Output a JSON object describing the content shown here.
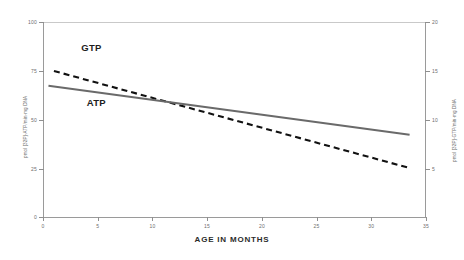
{
  "chart_data": {
    "type": "line",
    "title": "",
    "xlabel": "AGE IN MONTHS",
    "ylabel_left": "pmol [32P]-ATP/min·mg DNA",
    "ylabel_right": "pmol [32P]-GTP/min·mg DNA",
    "xlim": [
      0,
      35
    ],
    "ylim_left": [
      0,
      100
    ],
    "ylim_right": [
      0,
      20
    ],
    "xticks": [
      "0",
      "5",
      "10",
      "15",
      "20",
      "25",
      "30",
      "35"
    ],
    "xtick_values": [
      0,
      5,
      10,
      15,
      20,
      25,
      30,
      35
    ],
    "yticks_left": [
      "100",
      "75",
      "50",
      "25",
      "0"
    ],
    "ytick_values_left": [
      100,
      75,
      50,
      25,
      0
    ],
    "yticks_right": [
      "20",
      "15",
      "10",
      "5",
      "0"
    ],
    "ytick_values_right": [
      20,
      15,
      10,
      5,
      0
    ],
    "grid": false,
    "legend_position": "inline-annotation",
    "series": [
      {
        "name": "GTP",
        "axis": "right",
        "style": "dashed",
        "color": "#111111",
        "x": [
          1.0,
          33.5
        ],
        "values": [
          15.0,
          5.1
        ],
        "label_x": 3.5,
        "label_y_left": 86
      },
      {
        "name": "ATP",
        "axis": "left",
        "style": "solid",
        "color": "#6a6a6a",
        "x": [
          0.5,
          33.5
        ],
        "values": [
          67.5,
          42.5
        ],
        "label_x": 4.0,
        "label_y_left": 58
      }
    ],
    "annotations": [
      {
        "text": "GTP",
        "note": "dashed series label, upper left"
      },
      {
        "text": "ATP",
        "note": "solid series label, below GTP"
      }
    ],
    "colors": {
      "axis": "#9a9a9a",
      "tick_text": "#6e6e6e",
      "gtp_line": "#111111",
      "atp_line": "#6a6a6a",
      "background": "#ffffff"
    }
  }
}
